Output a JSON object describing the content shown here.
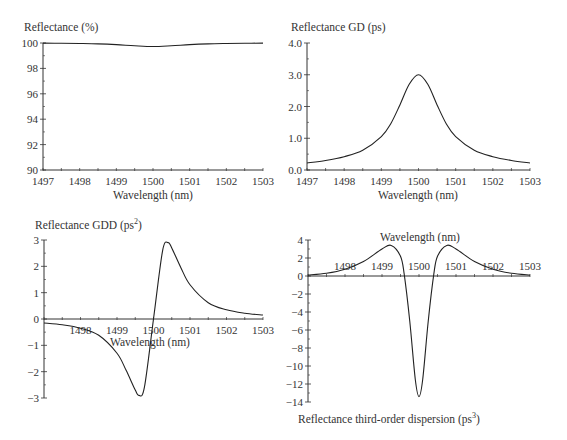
{
  "chart_data": [
    {
      "id": "reflectance",
      "type": "line",
      "title": "Reflectance (%)",
      "xlabel": "Wavelength (nm)",
      "ylabel": "Reflectance (%)",
      "xlim": [
        1497,
        1503
      ],
      "ylim": [
        90,
        100
      ],
      "xticks": [
        1497,
        1498,
        1499,
        1500,
        1501,
        1502,
        1503
      ],
      "yticks": [
        "90",
        "92",
        "94",
        "96",
        "98",
        "100"
      ],
      "ytick_values": [
        90,
        92,
        94,
        96,
        98,
        100
      ],
      "grid": false,
      "series": [
        {
          "name": "Reflectance",
          "x": [
            1497,
            1497.5,
            1498,
            1498.5,
            1499,
            1499.5,
            1500,
            1500.5,
            1501,
            1501.5,
            1502,
            1502.5,
            1503
          ],
          "y": [
            99.99,
            99.98,
            99.96,
            99.93,
            99.87,
            99.78,
            99.72,
            99.78,
            99.87,
            99.93,
            99.96,
            99.98,
            99.99
          ]
        }
      ]
    },
    {
      "id": "gd",
      "type": "line",
      "title": "Reflectance GD (ps)",
      "xlabel": "Wavelength (nm)",
      "ylabel": "Reflectance GD (ps)",
      "xlim": [
        1497,
        1503
      ],
      "ylim": [
        0,
        4
      ],
      "xticks": [
        1497,
        1498,
        1499,
        1500,
        1501,
        1502,
        1503
      ],
      "yticks": [
        "0.0",
        "1.0",
        "2.0",
        "3.0",
        "4.0"
      ],
      "ytick_values": [
        0,
        1,
        2,
        3,
        4
      ],
      "grid": false,
      "series": [
        {
          "name": "GD",
          "x": [
            1497,
            1497.5,
            1498,
            1498.5,
            1499,
            1499.25,
            1499.5,
            1499.75,
            1500,
            1500.25,
            1500.5,
            1500.75,
            1501,
            1501.5,
            1502,
            1502.5,
            1503
          ],
          "y": [
            0.22,
            0.3,
            0.42,
            0.62,
            1.05,
            1.45,
            2.05,
            2.7,
            3.0,
            2.7,
            2.05,
            1.45,
            1.05,
            0.62,
            0.42,
            0.3,
            0.22
          ]
        }
      ]
    },
    {
      "id": "gdd",
      "type": "line",
      "title": "Reflectance GDD (ps²)",
      "xlabel": "Wavelength (nm)",
      "ylabel": "Reflectance GDD (ps²)",
      "xlim": [
        1497,
        1503
      ],
      "ylim": [
        -3,
        3
      ],
      "xticks": [
        1498,
        1499,
        1500,
        1501,
        1502,
        1503
      ],
      "yticks": [
        "-3",
        "-2",
        "-1",
        "0",
        "1",
        "2",
        "3"
      ],
      "ytick_values": [
        -3,
        -2,
        -1,
        0,
        1,
        2,
        3
      ],
      "grid": false,
      "series": [
        {
          "name": "GDD",
          "x": [
            1497,
            1497.5,
            1498,
            1498.5,
            1499,
            1499.25,
            1499.5,
            1499.6,
            1499.75,
            1500,
            1500.25,
            1500.4,
            1500.5,
            1500.75,
            1501,
            1501.5,
            1502,
            1502.5,
            1503
          ],
          "y": [
            -0.15,
            -0.22,
            -0.35,
            -0.62,
            -1.3,
            -1.95,
            -2.7,
            -2.9,
            -2.6,
            0.0,
            2.6,
            2.9,
            2.7,
            1.95,
            1.3,
            0.62,
            0.35,
            0.22,
            0.15
          ]
        }
      ]
    },
    {
      "id": "tod",
      "type": "line",
      "title": "Reflectance third-order dispersion (ps³)",
      "xlabel": "Wavelength (nm)",
      "ylabel": "Reflectance third-order dispersion (ps³)",
      "xlim": [
        1497,
        1503
      ],
      "ylim": [
        -14,
        4
      ],
      "xticks": [
        1498,
        1499,
        1500,
        1501,
        1502,
        1503
      ],
      "yticks": [
        "-14",
        "-12",
        "-10",
        "-8",
        "-6",
        "-4",
        "-2",
        "0",
        "2",
        "4"
      ],
      "ytick_values": [
        -14,
        -12,
        -10,
        -8,
        -6,
        -4,
        -2,
        0,
        2,
        4
      ],
      "grid": false,
      "series": [
        {
          "name": "TOD",
          "x": [
            1497,
            1497.5,
            1498,
            1498.5,
            1499,
            1499.25,
            1499.5,
            1499.6,
            1499.75,
            1499.9,
            1500,
            1500.1,
            1500.25,
            1500.4,
            1500.5,
            1500.75,
            1501,
            1501.5,
            1502,
            1502.5,
            1503
          ],
          "y": [
            0.1,
            0.3,
            0.75,
            1.6,
            3.0,
            3.4,
            2.2,
            0.2,
            -5.0,
            -11.5,
            -13.4,
            -11.5,
            -5.0,
            0.2,
            2.2,
            3.4,
            3.0,
            1.6,
            0.75,
            0.3,
            0.1
          ]
        }
      ]
    }
  ],
  "panels": {
    "reflectance": {
      "title": "Reflectance (%)",
      "xlabel": "Wavelength (nm)"
    },
    "gd": {
      "title": "Reflectance GD (ps)",
      "xlabel": "Wavelength (nm)"
    },
    "gdd": {
      "title_main": "Reflectance GDD (ps",
      "title_sup": "2",
      "title_end": ")",
      "xlabel": "Wavelength (nm)"
    },
    "tod": {
      "title_main": "Reflectance third-order dispersion (ps",
      "title_sup": "3",
      "title_end": ")",
      "xlabel": "Wavelength (nm)"
    }
  }
}
